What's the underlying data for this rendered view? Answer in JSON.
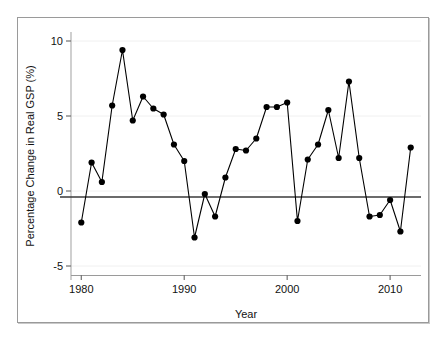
{
  "chart_data": {
    "type": "line",
    "title": "",
    "subtitle": "",
    "xlabel": "Year",
    "ylabel": "Percentage Change in Real GSP (%)",
    "xlim": [
      1979.0,
      2013.0
    ],
    "ylim": [
      -5.6,
      10.6
    ],
    "xticks": [
      1980,
      1990,
      2000,
      2010
    ],
    "xtick_labels": [
      "1980",
      "1990",
      "2000",
      "2010"
    ],
    "yticks": [
      -5,
      0,
      5,
      10
    ],
    "ytick_labels": [
      "-5",
      "0",
      "5",
      "10"
    ],
    "grid": "horizontal-faint",
    "legend": "none",
    "zero_line": 0,
    "marker": "filled-circle",
    "line_color": "#000000",
    "marker_color": "#000000",
    "frame_color": "#9a9a9a",
    "x": [
      1980,
      1981,
      1982,
      1983,
      1984,
      1985,
      1986,
      1987,
      1988,
      1989,
      1990,
      1991,
      1992,
      1993,
      1994,
      1995,
      1996,
      1997,
      1998,
      1999,
      2000,
      2001,
      2002,
      2003,
      2004,
      2005,
      2006,
      2007,
      2008,
      2009,
      2010,
      2011,
      2012
    ],
    "values": [
      -2.1,
      1.9,
      0.6,
      5.7,
      9.4,
      4.7,
      6.3,
      5.5,
      5.1,
      3.1,
      2.0,
      -3.1,
      -0.2,
      -1.7,
      0.9,
      2.8,
      2.7,
      3.5,
      5.6,
      5.6,
      5.9,
      -2.0,
      2.1,
      3.1,
      5.4,
      2.2,
      7.3,
      2.2,
      -1.7,
      -1.6,
      -0.6,
      -2.7,
      2.9
    ],
    "series": [
      {
        "name": "Percentage Change in Real GSP",
        "values": [
          -2.1,
          1.9,
          0.6,
          5.7,
          9.4,
          4.7,
          6.3,
          5.5,
          5.1,
          3.1,
          2.0,
          -3.1,
          -0.2,
          -1.7,
          0.9,
          2.8,
          2.7,
          3.5,
          5.6,
          5.6,
          5.9,
          -2.0,
          2.1,
          3.1,
          5.4,
          2.2,
          7.3,
          2.2,
          -1.7,
          -1.6,
          -0.6,
          -2.7,
          2.9
        ]
      }
    ]
  }
}
